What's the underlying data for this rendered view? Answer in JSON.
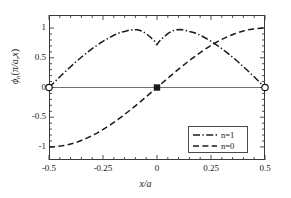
{
  "figure": {
    "xlabel_html": "x/a",
    "ylabel_parts": {
      "phi": "ϕ",
      "n": "n",
      "open": "(",
      "arg": "π/a,",
      "x": "x",
      "close": ")"
    }
  },
  "axes": {
    "xticks": [
      "-0.5",
      "-0.25",
      "0",
      "0.25",
      "0.5"
    ],
    "xtick_values": [
      -0.5,
      -0.25,
      0,
      0.25,
      0.5
    ],
    "yticks": [
      "1",
      "0.5",
      "0",
      "-0.5",
      "-1"
    ],
    "ytick_values": [
      1,
      0.5,
      0,
      -0.5,
      -1
    ]
  },
  "legend": {
    "entries": [
      {
        "label": "n=1",
        "style": "dash-dot",
        "color": "#1a1a1a"
      },
      {
        "label": "n=0",
        "style": "dashed",
        "color": "#1a1a1a"
      }
    ]
  },
  "colors": {
    "frame": "#3a3a3a",
    "curve": "#1a1a1a",
    "zero_line": "#6f6f6f",
    "background": "#ffffff"
  },
  "chart_data": {
    "type": "line",
    "title": "",
    "xlabel": "x/a",
    "ylabel": "ϕ_n(π/a, x)",
    "xlim": [
      -0.5,
      0.5
    ],
    "ylim": [
      -1.22,
      1.22
    ],
    "grid": false,
    "legend_position": "lower-right",
    "xticks": [
      -0.5,
      -0.25,
      0,
      0.25,
      0.5
    ],
    "yticks": [
      -1,
      -0.5,
      0,
      0.5,
      1
    ],
    "series": [
      {
        "name": "n=1",
        "style": "dash-dot",
        "x": [
          -0.5,
          -0.48,
          -0.46,
          -0.44,
          -0.42,
          -0.4,
          -0.38,
          -0.36,
          -0.34,
          -0.32,
          -0.3,
          -0.28,
          -0.26,
          -0.24,
          -0.22,
          -0.2,
          -0.18,
          -0.165,
          -0.15,
          -0.13,
          -0.11,
          -0.09,
          -0.07,
          -0.05,
          -0.03,
          -0.01,
          0.0,
          0.01,
          0.03,
          0.05,
          0.07,
          0.09,
          0.11,
          0.13,
          0.15,
          0.165,
          0.18,
          0.2,
          0.22,
          0.24,
          0.26,
          0.28,
          0.3,
          0.32,
          0.34,
          0.36,
          0.38,
          0.4,
          0.42,
          0.44,
          0.46,
          0.48,
          0.5
        ],
        "y": [
          0.0,
          0.072,
          0.144,
          0.214,
          0.283,
          0.35,
          0.416,
          0.479,
          0.54,
          0.598,
          0.653,
          0.705,
          0.754,
          0.799,
          0.841,
          0.879,
          0.913,
          0.93,
          0.943,
          0.963,
          0.975,
          0.972,
          0.95,
          0.906,
          0.845,
          0.775,
          0.72,
          0.775,
          0.845,
          0.906,
          0.95,
          0.972,
          0.975,
          0.963,
          0.943,
          0.93,
          0.913,
          0.879,
          0.841,
          0.799,
          0.754,
          0.705,
          0.653,
          0.598,
          0.54,
          0.479,
          0.416,
          0.35,
          0.283,
          0.214,
          0.144,
          0.072,
          0.0
        ]
      },
      {
        "name": "n=0",
        "style": "dashed",
        "x": [
          -0.5,
          -0.48,
          -0.46,
          -0.44,
          -0.42,
          -0.4,
          -0.38,
          -0.36,
          -0.34,
          -0.32,
          -0.3,
          -0.28,
          -0.26,
          -0.24,
          -0.22,
          -0.2,
          -0.18,
          -0.16,
          -0.14,
          -0.12,
          -0.1,
          -0.08,
          -0.06,
          -0.04,
          -0.02,
          0.0,
          0.02,
          0.04,
          0.06,
          0.08,
          0.1,
          0.12,
          0.14,
          0.16,
          0.18,
          0.2,
          0.22,
          0.24,
          0.26,
          0.28,
          0.3,
          0.32,
          0.34,
          0.36,
          0.38,
          0.4,
          0.42,
          0.44,
          0.46,
          0.48,
          0.5
        ],
        "y": [
          -1.0,
          -0.998,
          -0.992,
          -0.982,
          -0.969,
          -0.951,
          -0.93,
          -0.905,
          -0.876,
          -0.844,
          -0.809,
          -0.771,
          -0.729,
          -0.685,
          -0.637,
          -0.588,
          -0.535,
          -0.481,
          -0.425,
          -0.368,
          -0.309,
          -0.249,
          -0.187,
          -0.125,
          -0.063,
          0.0,
          0.063,
          0.125,
          0.187,
          0.249,
          0.309,
          0.368,
          0.425,
          0.481,
          0.535,
          0.588,
          0.637,
          0.685,
          0.729,
          0.771,
          0.809,
          0.844,
          0.876,
          0.905,
          0.93,
          0.951,
          0.969,
          0.982,
          0.992,
          0.998,
          1.0
        ]
      }
    ],
    "markers": [
      {
        "name": "open-circle-left",
        "x": -0.5,
        "y": 0,
        "shape": "open-circle"
      },
      {
        "name": "filled-square-center",
        "x": 0,
        "y": 0,
        "shape": "filled-square"
      },
      {
        "name": "open-circle-right",
        "x": 0.5,
        "y": 0,
        "shape": "open-circle"
      }
    ],
    "reference_lines": [
      {
        "name": "zero-line",
        "orientation": "horizontal",
        "value": 0
      }
    ]
  }
}
